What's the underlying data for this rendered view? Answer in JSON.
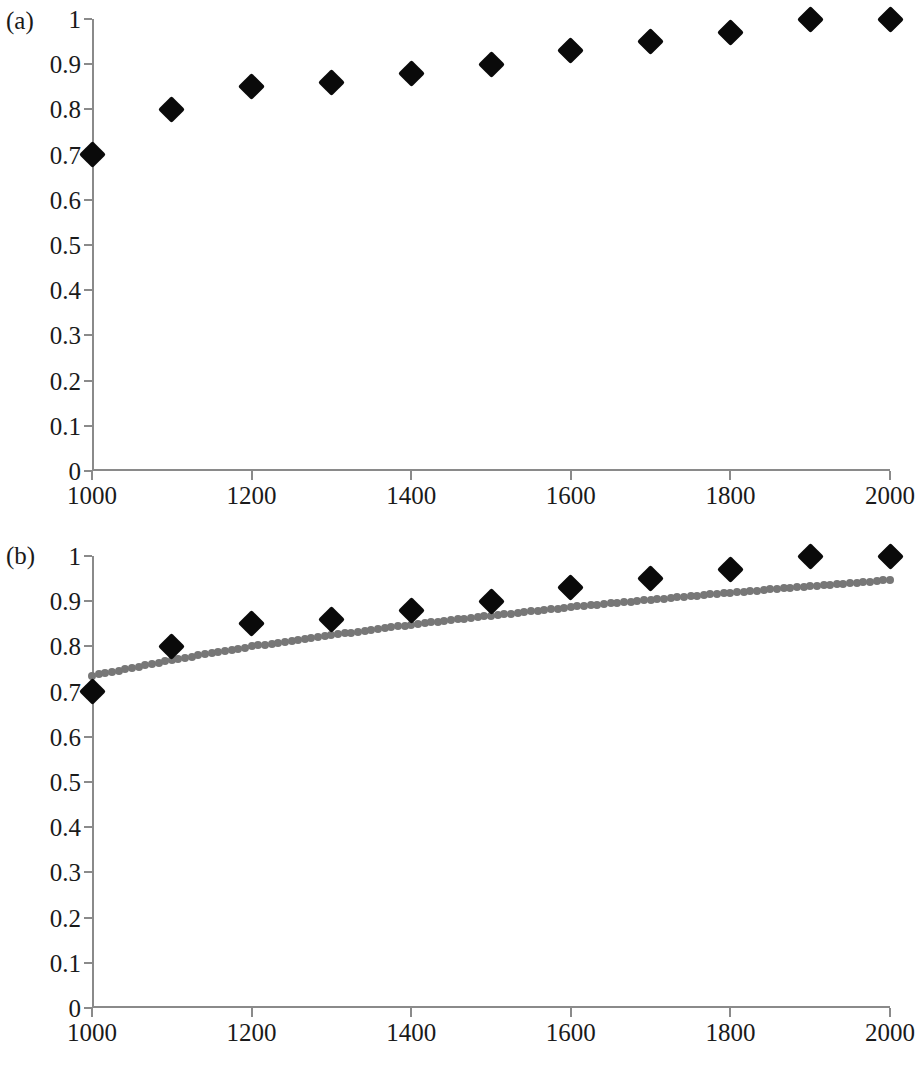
{
  "figure": {
    "panels": [
      {
        "id": "a",
        "label": "(a)"
      },
      {
        "id": "b",
        "label": "(b)"
      }
    ]
  },
  "chart_data": [
    {
      "type": "scatter",
      "panel": "(a)",
      "title": "",
      "xlabel": "",
      "ylabel": "",
      "xlim": [
        1000,
        2000
      ],
      "ylim": [
        0,
        1
      ],
      "grid": false,
      "legend": "none",
      "x_ticks": [
        1000,
        1200,
        1400,
        1600,
        1800,
        2000
      ],
      "x_tick_labels": [
        "1000",
        "1200",
        "1400",
        "1600",
        "1800",
        "2000"
      ],
      "x_minor_ticks": [
        1100,
        1300,
        1500,
        1700,
        1900
      ],
      "y_ticks": [
        0,
        0.1,
        0.2,
        0.3,
        0.4,
        0.5,
        0.6,
        0.7,
        0.8,
        0.9,
        1
      ],
      "y_tick_labels": [
        "0",
        "0.1",
        "0.2",
        "0.3",
        "0.4",
        "0.5",
        "0.6",
        "0.7",
        "0.8",
        "0.9",
        "1"
      ],
      "marker": "diamond",
      "marker_color": "#0a0a0a",
      "x": [
        1000,
        1100,
        1200,
        1300,
        1400,
        1500,
        1600,
        1700,
        1800,
        1900,
        2000
      ],
      "values": [
        0.7,
        0.8,
        0.85,
        0.86,
        0.88,
        0.9,
        0.93,
        0.95,
        0.97,
        1.0,
        1.0
      ]
    },
    {
      "type": "scatter",
      "panel": "(b)",
      "title": "",
      "xlabel": "",
      "ylabel": "",
      "xlim": [
        1000,
        2000
      ],
      "ylim": [
        0,
        1
      ],
      "grid": false,
      "legend": "none",
      "x_ticks": [
        1000,
        1200,
        1400,
        1600,
        1800,
        2000
      ],
      "x_tick_labels": [
        "1000",
        "1200",
        "1400",
        "1600",
        "1800",
        "2000"
      ],
      "x_minor_ticks": [
        1100,
        1300,
        1500,
        1700,
        1900
      ],
      "y_ticks": [
        0,
        0.1,
        0.2,
        0.3,
        0.4,
        0.5,
        0.6,
        0.7,
        0.8,
        0.9,
        1
      ],
      "y_tick_labels": [
        "0",
        "0.1",
        "0.2",
        "0.3",
        "0.4",
        "0.5",
        "0.6",
        "0.7",
        "0.8",
        "0.9",
        "1"
      ],
      "marker": "diamond",
      "marker_color": "#0a0a0a",
      "x": [
        1000,
        1100,
        1200,
        1300,
        1400,
        1500,
        1600,
        1700,
        1800,
        1900,
        2000
      ],
      "values": [
        0.7,
        0.8,
        0.85,
        0.86,
        0.88,
        0.9,
        0.93,
        0.95,
        0.97,
        1.0,
        1.0
      ],
      "series": [
        {
          "name": "trendline",
          "style": "dotted",
          "color": "#777777",
          "x": [
            1000,
            1100,
            1200,
            1300,
            1400,
            1500,
            1600,
            1700,
            1800,
            1900,
            2000
          ],
          "values": [
            0.735,
            0.77,
            0.8,
            0.825,
            0.848,
            0.868,
            0.887,
            0.903,
            0.919,
            0.933,
            0.947
          ]
        }
      ]
    }
  ]
}
